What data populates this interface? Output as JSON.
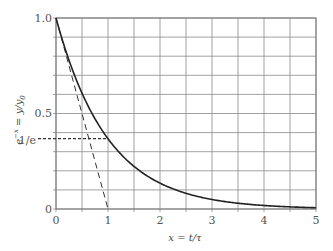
{
  "chart_data": {
    "type": "line",
    "title": "",
    "xlabel": "x = t/τ",
    "ylabel": "e^{-x} = y/y₀",
    "xlim": [
      0,
      5
    ],
    "ylim": [
      0,
      1.0
    ],
    "grid": true,
    "x_ticks": [
      "0",
      "1",
      "2",
      "3",
      "4",
      "5"
    ],
    "y_ticks": [
      "0",
      "1/e",
      "0.5",
      "1.0"
    ],
    "series": [
      {
        "name": "e^{-x}",
        "style": "solid",
        "x": [
          0,
          0.25,
          0.5,
          0.75,
          1,
          1.5,
          2,
          2.5,
          3,
          3.5,
          4,
          4.5,
          5
        ],
        "y": [
          1.0,
          0.779,
          0.607,
          0.472,
          0.368,
          0.223,
          0.135,
          0.082,
          0.05,
          0.03,
          0.018,
          0.011,
          0.007
        ]
      },
      {
        "name": "initial tangent",
        "style": "dashed",
        "x": [
          0,
          1
        ],
        "y": [
          1.0,
          0
        ]
      },
      {
        "name": "1/e level",
        "style": "dotted",
        "x": [
          0,
          1
        ],
        "y": [
          0.368,
          0.368
        ]
      }
    ],
    "annotations": [
      "1/e"
    ]
  },
  "labels": {
    "x_axis": "x = t/τ",
    "y_axis_base": "e",
    "y_axis_exp": "−x",
    "y_axis_rest": " = y/y",
    "y_axis_sub": "0",
    "tick_x": [
      "0",
      "1",
      "2",
      "3",
      "4",
      "5"
    ],
    "tick_y_top": "1.0",
    "tick_y_half": "0.5",
    "tick_y_inve": "1/e",
    "tick_y_zero": "0"
  }
}
